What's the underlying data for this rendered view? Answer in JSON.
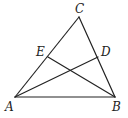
{
  "figure": {
    "type": "triangle-with-cevians",
    "points": {
      "A": {
        "label": "A",
        "x": 15,
        "y": 97,
        "lx": 5,
        "ly": 111
      },
      "B": {
        "label": "B",
        "x": 115,
        "y": 97,
        "lx": 112,
        "ly": 111
      },
      "C": {
        "label": "C",
        "x": 79,
        "y": 17,
        "lx": 75,
        "ly": 13
      },
      "D": {
        "label": "D",
        "x": 98,
        "y": 57,
        "lx": 101,
        "ly": 56
      },
      "E": {
        "label": "E",
        "x": 48,
        "y": 57,
        "lx": 36,
        "ly": 56
      }
    },
    "segments": [
      {
        "from": "A",
        "to": "B"
      },
      {
        "from": "A",
        "to": "C"
      },
      {
        "from": "B",
        "to": "C"
      },
      {
        "from": "A",
        "to": "D"
      },
      {
        "from": "B",
        "to": "E"
      }
    ],
    "line_color": "#222222"
  }
}
